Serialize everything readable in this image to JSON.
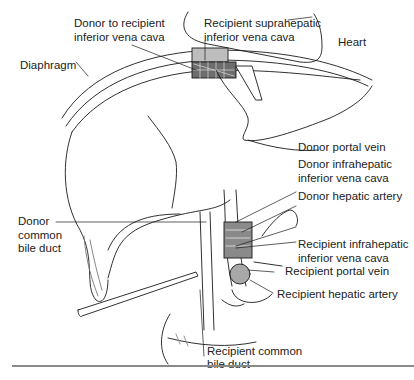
{
  "figure": {
    "type": "surgical-illustration",
    "signature": "MNS '91",
    "labels": [
      {
        "id": "donor-to-recipient-ivc",
        "lines": [
          "Donor to recipient",
          "inferior vena cava"
        ]
      },
      {
        "id": "recipient-suprahepatic-ivc",
        "lines": [
          "Recipient suprahepatic",
          "inferior vena cava"
        ]
      },
      {
        "id": "heart",
        "lines": [
          "Heart"
        ]
      },
      {
        "id": "diaphragm",
        "lines": [
          "Diaphragm"
        ]
      },
      {
        "id": "donor-portal-vein",
        "lines": [
          "Donor portal vein"
        ]
      },
      {
        "id": "donor-infrahepatic-ivc",
        "lines": [
          "Donor infrahepatic",
          "inferior vena cava"
        ]
      },
      {
        "id": "donor-hepatic-artery",
        "lines": [
          "Donor hepatic artery"
        ]
      },
      {
        "id": "donor-common-bile-duct",
        "lines": [
          "Donor",
          "common",
          "bile duct"
        ]
      },
      {
        "id": "recipient-infrahepatic-ivc",
        "lines": [
          "Recipient infrahepatic",
          "inferior vena cava"
        ]
      },
      {
        "id": "recipient-portal-vein",
        "lines": [
          "Recipient portal vein"
        ]
      },
      {
        "id": "recipient-hepatic-artery",
        "lines": [
          "Recipient hepatic artery"
        ]
      },
      {
        "id": "recipient-common-bile-duct",
        "lines": [
          "Recipient common",
          "bile duct"
        ]
      }
    ],
    "colors": {
      "line": "#1a1a1a",
      "shade": "#9a9a9a",
      "rule": "#8a8a8a",
      "background": "#ffffff"
    }
  }
}
